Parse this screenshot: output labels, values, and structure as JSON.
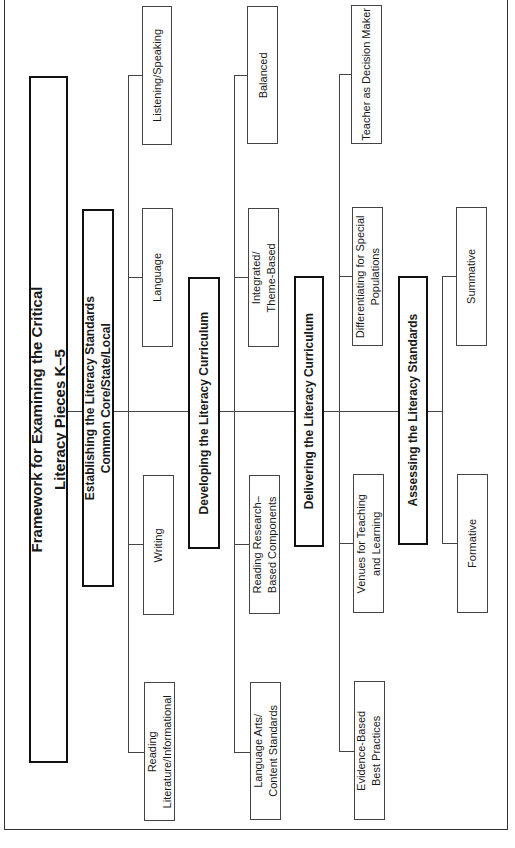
{
  "diagram": {
    "orientation": "rotated 90 degrees counter-clockwise",
    "title": {
      "line1": "Framework for Examining the Critical",
      "line2": "Literacy Pieces K–5"
    },
    "sections": [
      {
        "label_line1": "Establishing the Literacy Standards",
        "label_line2": "Common Core/State/Local",
        "children": [
          {
            "line1": "Reading",
            "line2": "Literature/Informational"
          },
          {
            "line1": "Writing"
          },
          {
            "line1": "Language"
          },
          {
            "line1": "Listening/Speaking"
          }
        ]
      },
      {
        "label_line1": "Developing the Literacy Curriculum",
        "children": [
          {
            "line1": "Language Arts/",
            "line2": "Content Standards"
          },
          {
            "line1": "Reading Research–",
            "line2": "Based Components"
          },
          {
            "line1": "Integrated/",
            "line2": "Theme-Based"
          },
          {
            "line1": "Balanced"
          }
        ]
      },
      {
        "label_line1": "Delivering the Literacy Curriculum",
        "children": [
          {
            "line1": "Evidence-Based",
            "line2": "Best Practices"
          },
          {
            "line1": "Venues for Teaching",
            "line2": "and Learning"
          },
          {
            "line1": "Differentiating for Special",
            "line2": "Populations"
          },
          {
            "line1": "Teacher as Decision Maker"
          }
        ]
      },
      {
        "label_line1": "Assessing the Literacy Standards",
        "children": [
          {
            "line1": "Formative"
          },
          {
            "line1": "Summative"
          }
        ]
      }
    ]
  }
}
